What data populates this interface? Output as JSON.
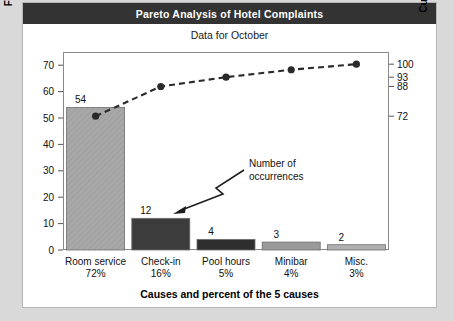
{
  "card": {
    "title": "Pareto Analysis of Hotel Complaints",
    "subtitle": "Data for October"
  },
  "chart_data": {
    "type": "bar",
    "title": "Pareto Analysis of Hotel Complaints",
    "subtitle": "Data for October",
    "xlabel": "Causes and percent of the 5 causes",
    "ylabel": "Frequency (number)",
    "y2label": "Cumulative percent",
    "categories": [
      "Room service",
      "Check-in",
      "Pool hours",
      "Minibar",
      "Misc."
    ],
    "category_percents": [
      "72%",
      "16%",
      "5%",
      "4%",
      "3%"
    ],
    "values": [
      54,
      12,
      4,
      3,
      2
    ],
    "bar_labels": [
      "54",
      "12",
      "4",
      "3",
      "2"
    ],
    "cumulative_percent": [
      72,
      88,
      93,
      97,
      100
    ],
    "ylim": [
      0,
      75
    ],
    "yticks": [
      0,
      10,
      20,
      30,
      40,
      50,
      60,
      70
    ],
    "ytick_labels": [
      "0",
      "10",
      "20",
      "30",
      "40",
      "50",
      "60",
      "70"
    ],
    "y2ticks": [
      72,
      88,
      93,
      100
    ],
    "y2tick_labels": [
      "72",
      "88",
      "93",
      "100"
    ],
    "grid": false,
    "legend": "none",
    "annotations": [
      {
        "text_line1": "Number of",
        "text_line2": "occurrences",
        "points_to": "Check-in"
      }
    ],
    "colors": {
      "bar_1": "#a8a8a8",
      "bar_2": "#3c3c3c",
      "bar_3": "#2e2e2e",
      "bar_4": "#9a9a9a",
      "bar_5": "#b0b0b0",
      "line": "#2a2a2a",
      "frame": "#8a8a8a",
      "title_bar": "#333333",
      "page_background": "#d9d9d9"
    }
  }
}
